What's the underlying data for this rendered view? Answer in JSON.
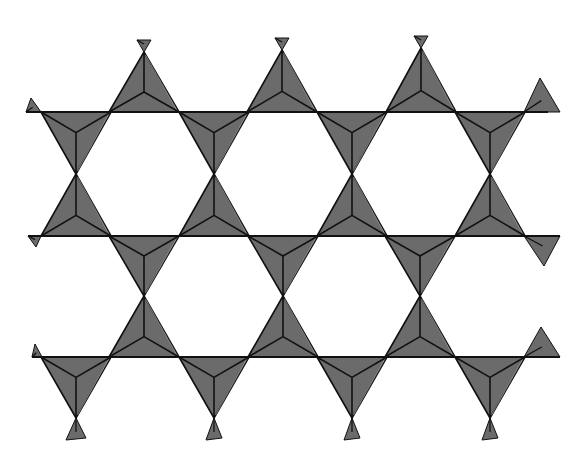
{
  "diagram": {
    "title": "",
    "colors": {
      "background": "#ffffff",
      "fill": "#6b6b6b",
      "edge": "#111111",
      "highlight": "#e8e8e8"
    },
    "geometry": {
      "half_base": 35,
      "height": 62,
      "lines_y": [
        112,
        236,
        357
      ],
      "line_x_extent": [
        [
          26,
          548
        ],
        [
          28,
          560
        ],
        [
          32,
          560
        ]
      ]
    },
    "tetrahedra": [
      {
        "id": "t-a1",
        "orient": "up",
        "apex": [
          144,
          52
        ],
        "base_y": 112
      },
      {
        "id": "t-a2",
        "orient": "up",
        "apex": [
          282,
          50
        ],
        "base_y": 112
      },
      {
        "id": "t-a3",
        "orient": "up",
        "apex": [
          421,
          48
        ],
        "base_y": 112
      },
      {
        "id": "t-b1",
        "orient": "down",
        "apex": [
          76,
          174
        ],
        "base_y": 112
      },
      {
        "id": "t-b2",
        "orient": "down",
        "apex": [
          214,
          174
        ],
        "base_y": 112
      },
      {
        "id": "t-b3",
        "orient": "down",
        "apex": [
          352,
          174
        ],
        "base_y": 112
      },
      {
        "id": "t-b4",
        "orient": "down",
        "apex": [
          490,
          174
        ],
        "base_y": 112
      },
      {
        "id": "t-c1",
        "orient": "up",
        "apex": [
          76,
          174
        ],
        "base_y": 236
      },
      {
        "id": "t-c2",
        "orient": "up",
        "apex": [
          214,
          174
        ],
        "base_y": 236
      },
      {
        "id": "t-c3",
        "orient": "up",
        "apex": [
          352,
          174
        ],
        "base_y": 236
      },
      {
        "id": "t-c4",
        "orient": "up",
        "apex": [
          490,
          174
        ],
        "base_y": 236
      },
      {
        "id": "t-d1",
        "orient": "down",
        "apex": [
          144,
          296
        ],
        "base_y": 236
      },
      {
        "id": "t-d2",
        "orient": "down",
        "apex": [
          283,
          296
        ],
        "base_y": 236
      },
      {
        "id": "t-d3",
        "orient": "down",
        "apex": [
          420,
          296
        ],
        "base_y": 236
      },
      {
        "id": "t-e1",
        "orient": "up",
        "apex": [
          144,
          296
        ],
        "base_y": 357
      },
      {
        "id": "t-e2",
        "orient": "up",
        "apex": [
          283,
          296
        ],
        "base_y": 357
      },
      {
        "id": "t-e3",
        "orient": "up",
        "apex": [
          420,
          296
        ],
        "base_y": 357
      },
      {
        "id": "t-f1",
        "orient": "down",
        "apex": [
          76,
          418
        ],
        "base_y": 357
      },
      {
        "id": "t-f2",
        "orient": "down",
        "apex": [
          214,
          418
        ],
        "base_y": 357
      },
      {
        "id": "t-f3",
        "orient": "down",
        "apex": [
          352,
          418
        ],
        "base_y": 357
      },
      {
        "id": "t-f4",
        "orient": "down",
        "apex": [
          490,
          418
        ],
        "base_y": 357
      }
    ],
    "partial_tetrahedra": [
      {
        "id": "p-top-1",
        "points": [
          [
            137,
            40
          ],
          [
            151,
            40
          ],
          [
            144,
            52
          ]
        ]
      },
      {
        "id": "p-top-2",
        "points": [
          [
            275,
            38
          ],
          [
            289,
            38
          ],
          [
            282,
            50
          ]
        ]
      },
      {
        "id": "p-top-3",
        "points": [
          [
            414,
            36
          ],
          [
            428,
            36
          ],
          [
            421,
            48
          ]
        ]
      },
      {
        "id": "p-left-1",
        "points": [
          [
            26,
            112
          ],
          [
            31,
            98
          ],
          [
            41,
            112
          ]
        ]
      },
      {
        "id": "p-right-1",
        "points": [
          [
            524,
            112
          ],
          [
            540,
            78
          ],
          [
            560,
            112
          ]
        ]
      },
      {
        "id": "p-left-2",
        "points": [
          [
            28,
            236
          ],
          [
            41,
            236
          ],
          [
            36,
            247
          ]
        ]
      },
      {
        "id": "p-right-2",
        "points": [
          [
            524,
            236
          ],
          [
            560,
            236
          ],
          [
            544,
            266
          ]
        ]
      },
      {
        "id": "p-left-3",
        "points": [
          [
            32,
            357
          ],
          [
            35,
            344
          ],
          [
            42,
            357
          ]
        ]
      },
      {
        "id": "p-right-3",
        "points": [
          [
            524,
            357
          ],
          [
            541,
            327
          ],
          [
            560,
            357
          ]
        ]
      },
      {
        "id": "p-bot-1",
        "points": [
          [
            76,
            418
          ],
          [
            66,
            440
          ],
          [
            86,
            438
          ]
        ]
      },
      {
        "id": "p-bot-2",
        "points": [
          [
            214,
            418
          ],
          [
            206,
            440
          ],
          [
            222,
            438
          ]
        ]
      },
      {
        "id": "p-bot-3",
        "points": [
          [
            352,
            418
          ],
          [
            344,
            440
          ],
          [
            360,
            438
          ]
        ]
      },
      {
        "id": "p-bot-4",
        "points": [
          [
            490,
            418
          ],
          [
            482,
            440
          ],
          [
            498,
            438
          ]
        ]
      }
    ]
  }
}
